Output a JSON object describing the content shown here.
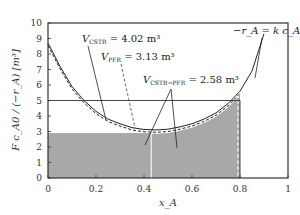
{
  "chart_data": {
    "type": "line",
    "title": "",
    "xlabel": "x_A",
    "ylabel": "F c_A0 / (−r_A) [m³]",
    "xlim": [
      0,
      1
    ],
    "ylim": [
      0,
      10
    ],
    "xticks": [
      "0",
      "0.2",
      "0.4",
      "0.6",
      "0.8",
      "1"
    ],
    "yticks": [
      "0",
      "1",
      "2",
      "3",
      "4",
      "5",
      "6",
      "7",
      "8",
      "9",
      "10"
    ],
    "grid": false,
    "series": [
      {
        "name": "levenspiel_curve",
        "style": "solid",
        "x": [
          0,
          0.05,
          0.1,
          0.15,
          0.2,
          0.25,
          0.3,
          0.35,
          0.4,
          0.45,
          0.5,
          0.55,
          0.6,
          0.65,
          0.7,
          0.75,
          0.8,
          0.85,
          0.9
        ],
        "y": [
          8.7,
          7.2,
          5.9,
          5.0,
          4.3,
          3.8,
          3.5,
          3.25,
          3.13,
          3.1,
          3.15,
          3.3,
          3.5,
          3.8,
          4.2,
          4.8,
          5.6,
          6.9,
          9.3
        ]
      },
      {
        "name": "levenspiel_curve_dashed",
        "style": "dashed",
        "x": [
          0,
          0.05,
          0.1,
          0.15,
          0.2,
          0.25,
          0.3,
          0.35,
          0.4,
          0.45,
          0.5,
          0.55,
          0.6,
          0.65,
          0.7,
          0.75,
          0.8
        ],
        "y": [
          8.55,
          7.05,
          5.75,
          4.85,
          4.15,
          3.65,
          3.35,
          3.1,
          2.98,
          2.95,
          3.0,
          3.15,
          3.35,
          3.65,
          4.05,
          4.65,
          5.45
        ]
      }
    ],
    "regions": [
      {
        "name": "cstr_rectangle",
        "x_range": [
          0,
          0.8
        ],
        "y_level": 5.0,
        "style": "outline"
      },
      {
        "name": "cstr_part_of_series",
        "x_range": [
          0,
          0.43
        ],
        "y_level": 2.9,
        "style": "shaded"
      },
      {
        "name": "pfr_part_of_series",
        "x_range": [
          0.43,
          0.8
        ],
        "style": "shaded-under-curve"
      }
    ],
    "annotations": [
      {
        "id": "cstr",
        "main": "V",
        "sub": "CSTR",
        "text": " = 4.02 m³"
      },
      {
        "id": "pfr",
        "main": "V",
        "sub": "PFR",
        "text": " = 3.13 m³"
      },
      {
        "id": "series",
        "main": "V",
        "sub": "CSTR→PFR",
        "text": " = 2.58 m³"
      },
      {
        "id": "rate",
        "text": "−r_A = k c_A c_C"
      }
    ],
    "legend": "none"
  }
}
